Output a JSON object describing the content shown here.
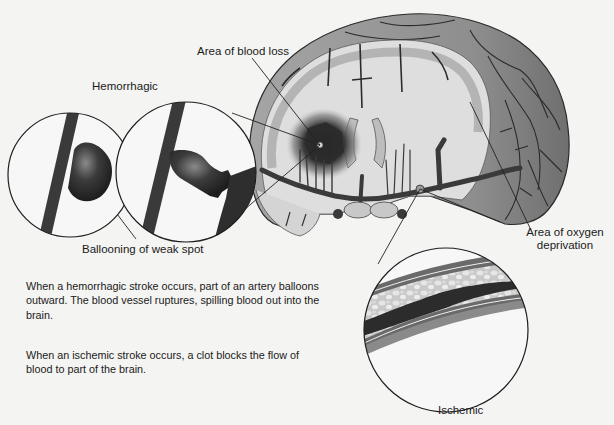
{
  "figure": {
    "labels": {
      "area_of_blood_loss": "Area of blood loss",
      "hemorrhagic": "Hemorrhagic",
      "ballooning_of_weak_spot": "Ballooning of weak spot",
      "area_of_oxygen_deprivation_line1": "Area of oxygen",
      "area_of_oxygen_deprivation_line2": "deprivation",
      "ischemic": "Ischemic"
    },
    "captions": {
      "hemorrhagic_description": "When a hemorrhagic stroke occurs, part of an artery balloons outward. The blood vessel ruptures, spilling blood out into the brain.",
      "ischemic_description": "When an ischemic stroke occurs, a clot blocks the flow of blood to part of the brain."
    },
    "colors": {
      "background": "#f4f4f2",
      "brain_cortex": "#9a9a9a",
      "brain_white_matter": "#dcdcdc",
      "vessel": "#3a3a3a",
      "lesion": "#2e2e2e",
      "outline": "#222222"
    }
  }
}
